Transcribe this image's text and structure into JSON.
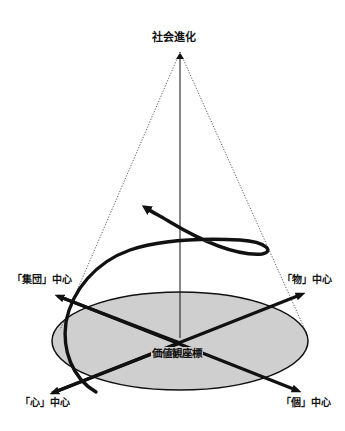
{
  "diagram": {
    "title": "社会進化",
    "center_label": "価値観座標",
    "axes": {
      "upper_left": "「集団」中心",
      "upper_right": "「物」中心",
      "lower_left": "「心」中心",
      "lower_right": "「個」中心"
    },
    "colors": {
      "ellipse_fill": "#cfcfcf",
      "stroke": "#111111",
      "background": "#ffffff"
    },
    "elements": {
      "cone_apex": "top center, labeled 社会進化",
      "base": "gray ellipse (value coordinate plane)",
      "spiral": "thick black spiral rising from base with arrowhead pointing upper-left"
    }
  }
}
